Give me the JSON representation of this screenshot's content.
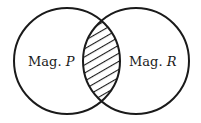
{
  "diagram": {
    "type": "venn",
    "sets": [
      {
        "id": "P",
        "label_prefix": "Mag. ",
        "label_var": "P",
        "cx": 67,
        "cy": 61,
        "r": 53
      },
      {
        "id": "R",
        "label_prefix": "Mag. ",
        "label_var": "R",
        "cx": 136,
        "cy": 61,
        "r": 53
      }
    ],
    "highlighted_region": "intersection",
    "highlight_style": "diagonal-hatch",
    "colors": {
      "stroke": "#1a1a1a",
      "background": "#ffffff",
      "hatch": "#1a1a1a"
    }
  }
}
